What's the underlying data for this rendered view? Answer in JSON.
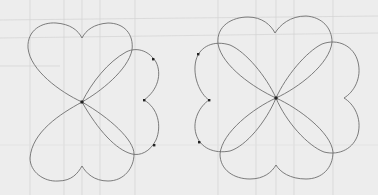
{
  "diagram": {
    "colors": {
      "background": "#ededed",
      "grid": "#cfcfcf",
      "curve": "#6e6e6e",
      "dot": "#222222"
    },
    "figures": [
      {
        "id": "left-figure",
        "label": "three-lobe figure",
        "center": [
          82,
          102
        ],
        "lobes": [
          "top",
          "bottom",
          "right"
        ],
        "marked_points": [
          [
            153,
            59
          ],
          [
            144,
            100
          ],
          [
            154,
            145
          ]
        ]
      },
      {
        "id": "right-figure",
        "label": "four-lobe figure",
        "center": [
          276,
          98
        ],
        "lobes": [
          "top",
          "bottom",
          "right",
          "left"
        ],
        "marked_points": [
          [
            198,
            54
          ],
          [
            209,
            100
          ],
          [
            199,
            142
          ]
        ]
      }
    ]
  }
}
